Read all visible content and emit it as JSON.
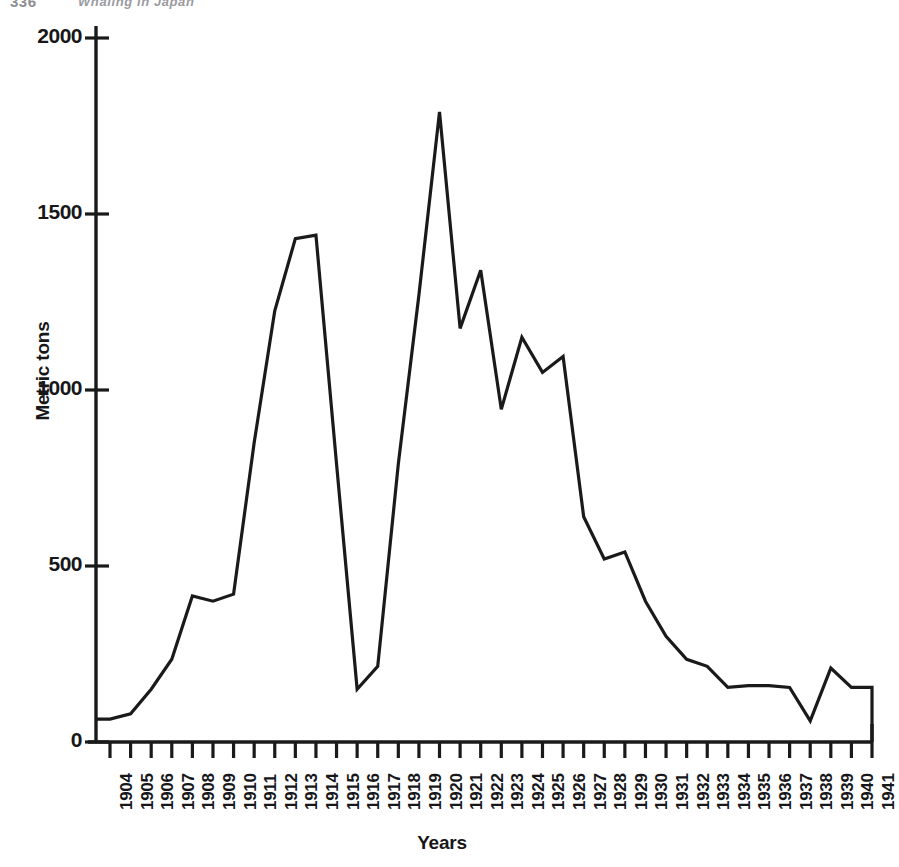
{
  "running_head": {
    "page_number": "336",
    "title": "Whaling in Japan"
  },
  "axes": {
    "ylabel": "Metric tons",
    "xlabel": "Years",
    "yticks": [
      "0",
      "500",
      "1000",
      "1500",
      "2000"
    ],
    "line_color": "#1a1a1a",
    "axis_color": "#1a1a1a"
  },
  "chart_data": {
    "type": "line",
    "title": "",
    "xlabel": "Years",
    "ylabel": "Metric tons",
    "ylim": [
      0,
      2000
    ],
    "yticks": [
      0,
      500,
      1000,
      1500,
      2000
    ],
    "grid": false,
    "legend": false,
    "x": [
      "1904",
      "1905",
      "1906",
      "1907",
      "1908",
      "1909",
      "1910",
      "1911",
      "1912",
      "1913",
      "1914",
      "1915",
      "1916",
      "1917",
      "1918",
      "1919",
      "1920",
      "1921",
      "1922",
      "1923",
      "1924",
      "1925",
      "1926",
      "1927",
      "1928",
      "1929",
      "1930",
      "1931",
      "1932",
      "1933",
      "1934",
      "1935",
      "1936",
      "1937",
      "1938",
      "1939",
      "1940",
      "1941"
    ],
    "values": [
      65,
      80,
      150,
      235,
      415,
      400,
      420,
      850,
      1225,
      1430,
      1440,
      790,
      150,
      215,
      790,
      1270,
      1790,
      1175,
      1340,
      945,
      1150,
      1050,
      1095,
      640,
      520,
      540,
      400,
      300,
      235,
      215,
      155,
      160,
      160,
      155,
      60,
      210,
      155,
      155
    ]
  }
}
